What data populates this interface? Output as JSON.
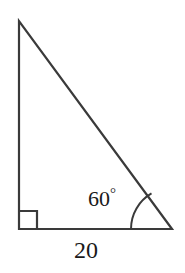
{
  "figure": {
    "background_color": "#ffffff",
    "stroke_color": "#3a3a3a",
    "text_color": "#1a1a1a",
    "stroke_width": 2.2
  },
  "labels": {
    "angle_value": "60",
    "degree_symbol": "°",
    "base_length": "20"
  },
  "geometry": {
    "shape": "right-triangle",
    "vertices": {
      "apex": {
        "name": "top-vertex",
        "x": 19,
        "y": 21
      },
      "right_angle": {
        "name": "bottom-left-vertex",
        "x": 19,
        "y": 229
      },
      "angle_vertex": {
        "name": "bottom-right-vertex",
        "x": 172,
        "y": 229
      }
    },
    "sides": [
      {
        "name": "vertical-leg",
        "from": "apex",
        "to": "right_angle"
      },
      {
        "name": "base-leg",
        "from": "right_angle",
        "to": "angle_vertex",
        "label": "20"
      },
      {
        "name": "hypotenuse",
        "from": "angle_vertex",
        "to": "apex"
      }
    ],
    "right_angle_marker": {
      "x": 19,
      "y": 211,
      "size": 18
    },
    "angle_arc": {
      "center_x": 172,
      "center_y": 229,
      "radius": 41,
      "measure_degrees": 60
    }
  }
}
